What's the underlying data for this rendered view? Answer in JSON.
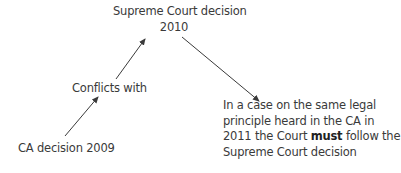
{
  "diagram": {
    "nodes": {
      "supreme_court": {
        "line1": "Supreme Court decision",
        "line2": "2010"
      },
      "conflicts": {
        "label": "Conflicts with"
      },
      "ca_decision": {
        "label": "CA decision 2009"
      },
      "result": {
        "line1": "In a case on the same legal",
        "line2": "principle heard in the CA in",
        "line3_pre": "2011 the Court ",
        "line3_bold": "must",
        "line3_post": " follow the",
        "line4": "Supreme Court decision"
      }
    },
    "edges": [
      {
        "from": "ca_decision",
        "to": "conflicts"
      },
      {
        "from": "conflicts",
        "to": "supreme_court"
      },
      {
        "from": "supreme_court",
        "to": "result"
      }
    ],
    "colors": {
      "text": "#3a3a3a",
      "arrow": "#3a3a3a",
      "background": "#ffffff"
    }
  }
}
